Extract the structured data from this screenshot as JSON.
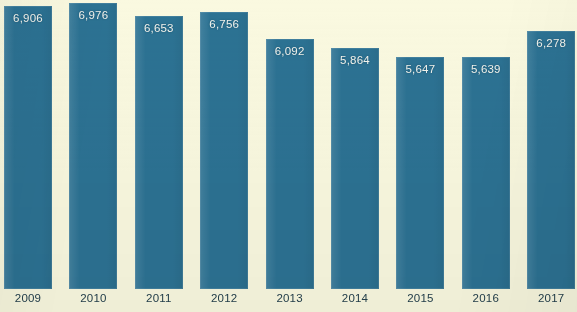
{
  "chart_data": {
    "type": "bar",
    "title": "",
    "subtitle": "",
    "xlabel": "",
    "ylabel": "",
    "grid": false,
    "legend": null,
    "ylim": [
      0,
      7200
    ],
    "categories": [
      "2009",
      "2010",
      "2011",
      "2012",
      "2013",
      "2014",
      "2015",
      "2016",
      "2017"
    ],
    "values": [
      6906,
      6976,
      6653,
      6756,
      6092,
      5864,
      5647,
      5639,
      6278
    ],
    "value_labels": [
      "6,906",
      "6,976",
      "6,653",
      "6,756",
      "6,092",
      "5,864",
      "5,647",
      "5,639",
      "6,278"
    ],
    "bars": [
      {
        "category": "2009",
        "value": 6906,
        "label": "6,906"
      },
      {
        "category": "2010",
        "value": 6976,
        "label": "6,976"
      },
      {
        "category": "2011",
        "value": 6653,
        "label": "6,653"
      },
      {
        "category": "2012",
        "value": 6756,
        "label": "6,756"
      },
      {
        "category": "2013",
        "value": 6092,
        "label": "6,092"
      },
      {
        "category": "2014",
        "value": 5864,
        "label": "5,864"
      },
      {
        "category": "2015",
        "value": 5647,
        "label": "5,647"
      },
      {
        "category": "2016",
        "value": 5639,
        "label": "5,639"
      },
      {
        "category": "2017",
        "value": 6278,
        "label": "6,278"
      }
    ]
  },
  "colors": {
    "bar": "#2c7293",
    "background": "#faf9e0",
    "value_label": "#f2f4ee",
    "axis_label": "#24404c"
  }
}
